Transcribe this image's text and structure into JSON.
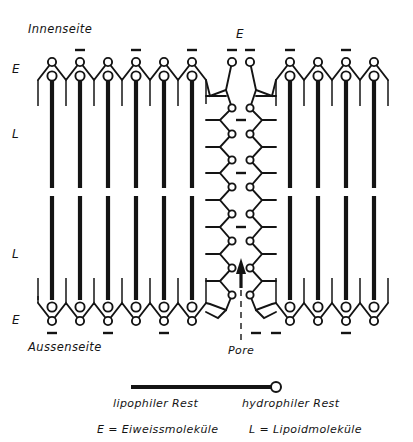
{
  "figure": {
    "type": "diagram",
    "labels": {
      "inner_side": "Innenseite",
      "outer_side": "Aussenseite",
      "protein_top_left": "E",
      "protein_top_pore": "E",
      "protein_bottom_left": "E",
      "lipid_upper": "L",
      "lipid_lower": "L",
      "pore": "Pore"
    },
    "legend": {
      "lipophilic": "lipophiler Rest",
      "hydrophilic": "hydrophiler Rest",
      "key_protein": "E = Eiweissmoleküle",
      "key_lipid": "L = Lipoidmoleküle"
    },
    "colors": {
      "ink": "#141414",
      "paper": "#ffffff"
    },
    "structure": {
      "left_lipid_columns": 6,
      "right_lipid_columns": 4,
      "leaflets": 2,
      "protein_layers": 2,
      "pore_present": true,
      "arrow_direction": "up"
    }
  }
}
